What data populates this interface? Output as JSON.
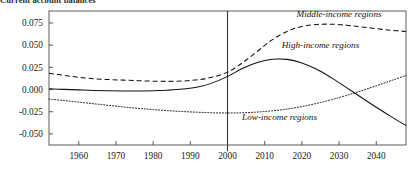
{
  "chart_data": {
    "type": "line",
    "title": "Current account balances",
    "xlabel": "",
    "ylabel": "",
    "xlim": [
      1952,
      2048
    ],
    "ylim": [
      -0.0625,
      0.0885
    ],
    "grid": false,
    "legend_position": "inline-annotations",
    "xticks": [
      1960,
      1970,
      1980,
      1990,
      2000,
      2010,
      2020,
      2030,
      2040
    ],
    "xtick_labels": [
      "1960",
      "1970",
      "1980",
      "1990",
      "2000",
      "2010",
      "2020",
      "2030",
      "2040"
    ],
    "yticks": [
      0.075,
      0.05,
      0.025,
      0.0,
      -0.025,
      -0.05
    ],
    "ytick_labels": [
      "0.075",
      "0.050",
      "0.025",
      "0.000",
      "-0.025",
      "-0.050"
    ],
    "annotations": [
      {
        "text": "Middle-income regions",
        "x": 2030,
        "y": 0.082
      },
      {
        "text": "High-income regions",
        "x": 2025,
        "y": 0.0465
      },
      {
        "text": "Low-income regions",
        "x": 2014,
        "y": -0.0345
      }
    ],
    "vertical_divider": {
      "x": 2000,
      "label": "2000"
    },
    "series": [
      {
        "name": "Middle-income regions",
        "style": "dashed",
        "color": "#111111",
        "x": [
          1952,
          1956,
          1960,
          1964,
          1968,
          1972,
          1976,
          1980,
          1984,
          1988,
          1992,
          1996,
          2000,
          2004,
          2008,
          2012,
          2016,
          2020,
          2024,
          2028,
          2032,
          2036,
          2040,
          2044,
          2048
        ],
        "values": [
          0.0183,
          0.016,
          0.0138,
          0.0122,
          0.0112,
          0.0106,
          0.01,
          0.0094,
          0.0092,
          0.0096,
          0.011,
          0.014,
          0.0196,
          0.03,
          0.043,
          0.056,
          0.0655,
          0.071,
          0.0733,
          0.0736,
          0.0725,
          0.0706,
          0.0686,
          0.0668,
          0.0654
        ]
      },
      {
        "name": "High-income regions",
        "style": "solid",
        "color": "#111111",
        "x": [
          1952,
          1956,
          1960,
          1964,
          1968,
          1972,
          1976,
          1980,
          1984,
          1988,
          1992,
          1996,
          2000,
          2004,
          2008,
          2012,
          2016,
          2020,
          2024,
          2028,
          2032,
          2036,
          2040,
          2044,
          2048
        ],
        "values": [
          0.0008,
          0.0002,
          -0.0004,
          -0.001,
          -0.0014,
          -0.0016,
          -0.0016,
          -0.0014,
          -0.0007,
          0.0005,
          0.0028,
          0.0075,
          0.0148,
          0.0236,
          0.0306,
          0.0341,
          0.034,
          0.03,
          0.0228,
          0.0131,
          0.0022,
          -0.009,
          -0.02,
          -0.0305,
          -0.0405
        ]
      },
      {
        "name": "Low-income regions",
        "style": "dotted",
        "color": "#111111",
        "x": [
          1952,
          1956,
          1960,
          1964,
          1968,
          1972,
          1976,
          1980,
          1984,
          1988,
          1992,
          1996,
          2000,
          2004,
          2008,
          2012,
          2016,
          2020,
          2024,
          2028,
          2032,
          2036,
          2040,
          2044,
          2048
        ],
        "values": [
          -0.0108,
          -0.0124,
          -0.0142,
          -0.016,
          -0.0178,
          -0.0196,
          -0.0212,
          -0.0226,
          -0.0238,
          -0.0248,
          -0.0256,
          -0.0262,
          -0.0264,
          -0.0262,
          -0.0254,
          -0.024,
          -0.022,
          -0.0192,
          -0.0156,
          -0.0114,
          -0.0066,
          -0.0014,
          0.0042,
          0.01,
          0.0158
        ]
      }
    ]
  }
}
